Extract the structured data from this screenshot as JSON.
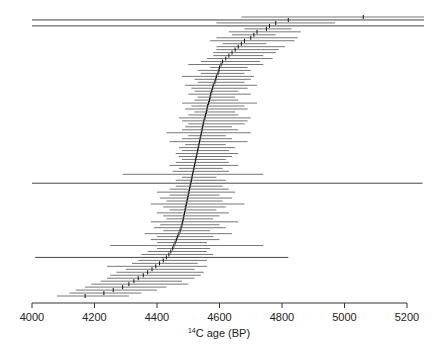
{
  "chart_data": {
    "type": "scatter",
    "subtype": "sorted-interval-plot",
    "title": "",
    "xlabel_sup": "14",
    "xlabel_main": "C age (BP)",
    "xlabel": "14C age (BP)",
    "ylabel": "",
    "xlim": [
      4000,
      5250
    ],
    "x_ticks": [
      4000,
      4200,
      4400,
      4600,
      4800,
      5000,
      5200
    ],
    "x_tick_labels": [
      "4000",
      "4200",
      "4400",
      "4600",
      "4800",
      "5000",
      "5200"
    ],
    "grid": false,
    "legend": null,
    "series": [
      {
        "name": "dates",
        "rows": [
          {
            "median": 5060,
            "low": 4670,
            "high": 5260
          },
          {
            "median": 4820,
            "low": 4000,
            "high": 5260
          },
          {
            "median": 4780,
            "low": 4590,
            "high": 4970
          },
          {
            "median": 4760,
            "low": 4000,
            "high": 5260
          },
          {
            "median": 4750,
            "low": 4680,
            "high": 4830
          },
          {
            "median": 4720,
            "low": 4630,
            "high": 4860
          },
          {
            "median": 4710,
            "low": 4640,
            "high": 4780
          },
          {
            "median": 4700,
            "low": 4590,
            "high": 4850
          },
          {
            "median": 4680,
            "low": 4570,
            "high": 4840
          },
          {
            "median": 4670,
            "low": 4610,
            "high": 4750
          },
          {
            "median": 4660,
            "low": 4590,
            "high": 4810
          },
          {
            "median": 4650,
            "low": 4590,
            "high": 4790
          },
          {
            "median": 4640,
            "low": 4580,
            "high": 4780
          },
          {
            "median": 4630,
            "low": 4580,
            "high": 4740
          },
          {
            "median": 4620,
            "low": 4560,
            "high": 4770
          },
          {
            "median": 4610,
            "low": 4540,
            "high": 4730
          },
          {
            "median": 4605,
            "low": 4500,
            "high": 4740
          },
          {
            "median": 4600,
            "low": 4570,
            "high": 4690
          },
          {
            "median": 4598,
            "low": 4530,
            "high": 4700
          },
          {
            "median": 4595,
            "low": 4540,
            "high": 4680
          },
          {
            "median": 4590,
            "low": 4480,
            "high": 4710
          },
          {
            "median": 4588,
            "low": 4520,
            "high": 4700
          },
          {
            "median": 4585,
            "low": 4530,
            "high": 4680
          },
          {
            "median": 4580,
            "low": 4490,
            "high": 4720
          },
          {
            "median": 4578,
            "low": 4510,
            "high": 4690
          },
          {
            "median": 4575,
            "low": 4520,
            "high": 4660
          },
          {
            "median": 4572,
            "low": 4500,
            "high": 4700
          },
          {
            "median": 4570,
            "low": 4530,
            "high": 4650
          },
          {
            "median": 4568,
            "low": 4520,
            "high": 4660
          },
          {
            "median": 4565,
            "low": 4480,
            "high": 4720
          },
          {
            "median": 4562,
            "low": 4510,
            "high": 4680
          },
          {
            "median": 4560,
            "low": 4490,
            "high": 4690
          },
          {
            "median": 4558,
            "low": 4520,
            "high": 4650
          },
          {
            "median": 4555,
            "low": 4500,
            "high": 4660
          },
          {
            "median": 4553,
            "low": 4470,
            "high": 4700
          },
          {
            "median": 4550,
            "low": 4480,
            "high": 4690
          },
          {
            "median": 4548,
            "low": 4500,
            "high": 4680
          },
          {
            "median": 4546,
            "low": 4490,
            "high": 4640
          },
          {
            "median": 4544,
            "low": 4480,
            "high": 4660
          },
          {
            "median": 4542,
            "low": 4430,
            "high": 4700
          },
          {
            "median": 4540,
            "low": 4500,
            "high": 4620
          },
          {
            "median": 4538,
            "low": 4480,
            "high": 4640
          },
          {
            "median": 4536,
            "low": 4440,
            "high": 4690
          },
          {
            "median": 4534,
            "low": 4490,
            "high": 4620
          },
          {
            "median": 4532,
            "low": 4470,
            "high": 4650
          },
          {
            "median": 4530,
            "low": 4480,
            "high": 4630
          },
          {
            "median": 4528,
            "low": 4460,
            "high": 4660
          },
          {
            "median": 4526,
            "low": 4470,
            "high": 4640
          },
          {
            "median": 4524,
            "low": 4480,
            "high": 4620
          },
          {
            "median": 4522,
            "low": 4460,
            "high": 4630
          },
          {
            "median": 4520,
            "low": 4440,
            "high": 4660
          },
          {
            "median": 4518,
            "low": 4470,
            "high": 4610
          },
          {
            "median": 4516,
            "low": 4450,
            "high": 4630
          },
          {
            "median": 4514,
            "low": 4290,
            "high": 4740
          },
          {
            "median": 4512,
            "low": 4480,
            "high": 4590
          },
          {
            "median": 4510,
            "low": 4460,
            "high": 4620
          },
          {
            "median": 4508,
            "low": 4000,
            "high": 5250
          },
          {
            "median": 4506,
            "low": 4460,
            "high": 4610
          },
          {
            "median": 4504,
            "low": 4440,
            "high": 4630
          },
          {
            "median": 4502,
            "low": 4400,
            "high": 4650
          },
          {
            "median": 4500,
            "low": 4440,
            "high": 4600
          },
          {
            "median": 4498,
            "low": 4410,
            "high": 4640
          },
          {
            "median": 4496,
            "low": 4430,
            "high": 4610
          },
          {
            "median": 4494,
            "low": 4380,
            "high": 4680
          },
          {
            "median": 4492,
            "low": 4420,
            "high": 4620
          },
          {
            "median": 4490,
            "low": 4440,
            "high": 4590
          },
          {
            "median": 4488,
            "low": 4400,
            "high": 4630
          },
          {
            "median": 4486,
            "low": 4420,
            "high": 4600
          },
          {
            "median": 4484,
            "low": 4430,
            "high": 4580
          },
          {
            "median": 4482,
            "low": 4380,
            "high": 4660
          },
          {
            "median": 4480,
            "low": 4410,
            "high": 4600
          },
          {
            "median": 4477,
            "low": 4390,
            "high": 4620
          },
          {
            "median": 4474,
            "low": 4420,
            "high": 4570
          },
          {
            "median": 4470,
            "low": 4360,
            "high": 4640
          },
          {
            "median": 4466,
            "low": 4400,
            "high": 4580
          },
          {
            "median": 4462,
            "low": 4380,
            "high": 4600
          },
          {
            "median": 4458,
            "low": 4400,
            "high": 4560
          },
          {
            "median": 4454,
            "low": 4250,
            "high": 4740
          },
          {
            "median": 4450,
            "low": 4400,
            "high": 4570
          },
          {
            "median": 4444,
            "low": 4370,
            "high": 4560
          },
          {
            "median": 4438,
            "low": 4350,
            "high": 4580
          },
          {
            "median": 4430,
            "low": 4010,
            "high": 4820
          },
          {
            "median": 4420,
            "low": 4340,
            "high": 4560
          },
          {
            "median": 4408,
            "low": 4320,
            "high": 4530
          },
          {
            "median": 4396,
            "low": 4240,
            "high": 4560
          },
          {
            "median": 4384,
            "low": 4300,
            "high": 4520
          },
          {
            "median": 4370,
            "low": 4270,
            "high": 4550
          },
          {
            "median": 4356,
            "low": 4250,
            "high": 4540
          },
          {
            "median": 4340,
            "low": 4240,
            "high": 4520
          },
          {
            "median": 4326,
            "low": 4220,
            "high": 4480
          },
          {
            "median": 4310,
            "low": 4190,
            "high": 4500
          },
          {
            "median": 4290,
            "low": 4170,
            "high": 4430
          },
          {
            "median": 4260,
            "low": 4140,
            "high": 4400
          },
          {
            "median": 4230,
            "low": 4120,
            "high": 4350
          },
          {
            "median": 4170,
            "low": 4080,
            "high": 4310
          }
        ]
      }
    ]
  }
}
